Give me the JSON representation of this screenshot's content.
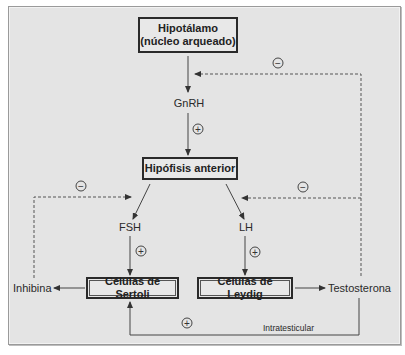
{
  "diagram": {
    "nodes": {
      "hypothalamus": {
        "line1": "Hipotálamo",
        "line2": "(núcleo arqueado)"
      },
      "pituitary": {
        "label": "Hipófisis anterior"
      },
      "sertoli": {
        "label": "Células de Sertoli"
      },
      "leydig": {
        "label": "Células de Leydig"
      }
    },
    "hormones": {
      "gnrh": "GnRH",
      "fsh": "FSH",
      "lh": "LH",
      "inhibin": "Inhibina",
      "testosterone": "Testosterona"
    },
    "annotations": {
      "intratesticular": "Intratesticular"
    },
    "signs": {
      "gnrh_to_pituitary": "+",
      "fsh_to_sertoli": "+",
      "lh_to_leydig": "+",
      "testosterone_to_sertoli": "+",
      "testosterone_to_hypothalamus": "−",
      "testosterone_to_pituitary": "−",
      "inhibin_to_pituitary": "−"
    },
    "colors": {
      "background": "#e4e4e4",
      "line": "#333333",
      "box_border": "#2a2a2a"
    }
  }
}
